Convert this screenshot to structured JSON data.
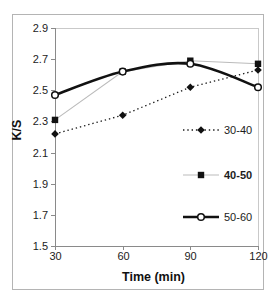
{
  "figure": {
    "background": "#ffffff",
    "border_color": "#b4b4b4",
    "axis_color": "#8a8a8a",
    "frame_color": "#c9c9c9",
    "text_color": "#1c1c1c"
  },
  "chart_data": {
    "type": "line",
    "title": "",
    "xlabel": "Time (min)",
    "ylabel": "K/S",
    "x": [
      30,
      60,
      90,
      120
    ],
    "xtick_labels": [
      "30",
      "60",
      "90",
      "120"
    ],
    "xlim": [
      30,
      120
    ],
    "ylim": [
      1.5,
      2.9
    ],
    "yticks": [
      2.9,
      2.7,
      2.5,
      2.3,
      2.1,
      1.9,
      1.7,
      1.5
    ],
    "ytick_labels": [
      "2.9",
      "2.7",
      "2.5",
      "2.3",
      "2.1",
      "1.9",
      "1.7",
      "1.5"
    ],
    "grid": false,
    "legend_position": "inside-right",
    "series": [
      {
        "name": "30-40",
        "values": [
          2.22,
          2.34,
          2.52,
          2.63
        ],
        "marker": "filled-diamond",
        "marker_color": "#111111",
        "line_style": "dotted",
        "line_color": "#1a1a1a",
        "line_width": 1.3,
        "smooth": false,
        "legend_bold": false
      },
      {
        "name": "40-50",
        "values": [
          2.31,
          2.62,
          2.69,
          2.67
        ],
        "marker": "filled-square",
        "marker_color": "#111111",
        "line_style": "solid",
        "line_color": "#bbbbbb",
        "line_width": 1.1,
        "smooth": false,
        "legend_bold": true
      },
      {
        "name": "50-60",
        "values": [
          2.47,
          2.62,
          2.67,
          2.52
        ],
        "marker": "open-circle",
        "marker_color": "#111111",
        "line_style": "solid",
        "line_color": "#111111",
        "line_width": 2.6,
        "smooth": true,
        "legend_bold": false
      }
    ]
  }
}
